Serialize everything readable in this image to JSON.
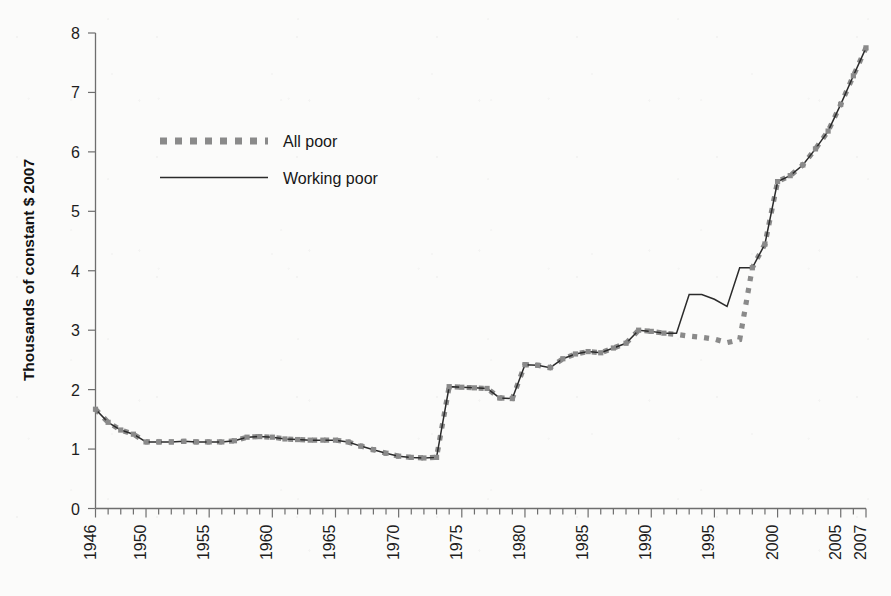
{
  "chart_data": {
    "type": "line",
    "title": "",
    "xlabel": "",
    "ylabel": "Thousands of constant $ 2007",
    "xlim": [
      1946,
      2007
    ],
    "ylim": [
      0,
      8
    ],
    "ytick_labels": [
      "0",
      "1",
      "2",
      "3",
      "4",
      "5",
      "6",
      "7",
      "8"
    ],
    "ytick_values": [
      0,
      1,
      2,
      3,
      4,
      5,
      6,
      7,
      8
    ],
    "xtick_labels": [
      "1946",
      "1950",
      "1955",
      "1960",
      "1965",
      "1970",
      "1975",
      "1980",
      "1985",
      "1990",
      "1995",
      "2000",
      "2005",
      "2007"
    ],
    "xtick_values": [
      1946,
      1950,
      1955,
      1960,
      1965,
      1970,
      1975,
      1980,
      1985,
      1990,
      1995,
      2000,
      2005,
      2007
    ],
    "x": [
      1946,
      1947,
      1948,
      1949,
      1950,
      1951,
      1952,
      1953,
      1954,
      1955,
      1956,
      1957,
      1958,
      1959,
      1960,
      1961,
      1962,
      1963,
      1964,
      1965,
      1966,
      1967,
      1968,
      1969,
      1970,
      1971,
      1972,
      1973,
      1974,
      1975,
      1976,
      1977,
      1978,
      1979,
      1980,
      1981,
      1982,
      1983,
      1984,
      1985,
      1986,
      1987,
      1988,
      1989,
      1990,
      1991,
      1992,
      1993,
      1994,
      1995,
      1996,
      1997,
      1998,
      1999,
      2000,
      2001,
      2002,
      2003,
      2004,
      2005,
      2006,
      2007
    ],
    "grid": false,
    "legend_position": "upper-left",
    "series": [
      {
        "name": "All poor",
        "style": "dashed-thick-gray",
        "color": "#8a8a8a",
        "values": [
          1.67,
          1.45,
          1.32,
          1.25,
          1.12,
          1.12,
          1.12,
          1.13,
          1.12,
          1.12,
          1.12,
          1.14,
          1.2,
          1.21,
          1.2,
          1.17,
          1.16,
          1.15,
          1.15,
          1.15,
          1.12,
          1.05,
          0.99,
          0.93,
          0.88,
          0.86,
          0.85,
          0.86,
          2.05,
          2.04,
          2.03,
          2.02,
          1.86,
          1.85,
          2.42,
          2.41,
          2.37,
          2.52,
          2.6,
          2.64,
          2.62,
          2.7,
          2.78,
          3.0,
          2.98,
          2.95,
          2.93,
          2.9,
          2.88,
          2.85,
          2.79,
          2.84,
          4.05,
          4.45,
          5.5,
          5.6,
          5.78,
          6.05,
          6.35,
          6.8,
          7.28,
          7.75
        ]
      },
      {
        "name": "Working poor",
        "style": "solid-thin-black",
        "color": "#2b2b2b",
        "values": [
          1.67,
          1.45,
          1.32,
          1.25,
          1.12,
          1.12,
          1.12,
          1.13,
          1.12,
          1.12,
          1.12,
          1.14,
          1.2,
          1.21,
          1.2,
          1.17,
          1.16,
          1.15,
          1.15,
          1.15,
          1.12,
          1.05,
          0.99,
          0.93,
          0.88,
          0.86,
          0.85,
          0.86,
          2.05,
          2.04,
          2.03,
          2.02,
          1.86,
          1.85,
          2.42,
          2.41,
          2.37,
          2.52,
          2.6,
          2.64,
          2.62,
          2.7,
          2.78,
          3.0,
          2.98,
          2.95,
          2.95,
          3.6,
          3.6,
          3.52,
          3.4,
          4.05,
          4.05,
          4.45,
          5.5,
          5.6,
          5.78,
          6.05,
          6.35,
          6.8,
          7.28,
          7.75
        ]
      }
    ],
    "legend": [
      {
        "label": "All poor",
        "swatch": "dashed-gray-thick"
      },
      {
        "label": "Working poor",
        "swatch": "solid-black-thin"
      }
    ],
    "colors": {
      "all_poor": "#8a8a8a",
      "working_poor": "#2b2b2b",
      "axis": "#6e6e6e",
      "background": "#fbfbfa"
    }
  }
}
